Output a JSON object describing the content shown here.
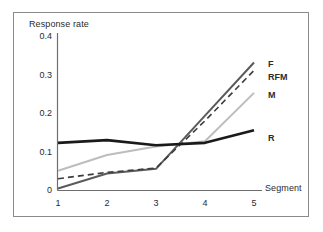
{
  "chart_data": {
    "type": "line",
    "title": "",
    "xlabel": "Segment",
    "ylabel": "Response rate",
    "x": [
      1,
      2,
      3,
      4,
      5
    ],
    "categories": [
      "1",
      "2",
      "3",
      "4",
      "5"
    ],
    "xtick_labels": [
      "1",
      "2",
      "3",
      "4",
      "5"
    ],
    "ytick_labels": [
      "0.4",
      "0.3",
      "0.2",
      "0.1",
      "0"
    ],
    "ytick_values": [
      0.4,
      0.3,
      0.2,
      0.1,
      0
    ],
    "xlim": [
      1,
      5
    ],
    "ylim": [
      0,
      0.4
    ],
    "grid": false,
    "legend_position": "right-inline",
    "series": [
      {
        "name": "F",
        "label": "F",
        "values": [
          0.005,
          0.043,
          0.055,
          0.19,
          0.325
        ],
        "color": "#5a5a5a",
        "style": "solid",
        "width": 2.0
      },
      {
        "name": "RFM",
        "label": "RFM",
        "values": [
          0.03,
          0.046,
          0.057,
          0.177,
          0.305
        ],
        "color": "#3d3d3d",
        "style": "dashed",
        "width": 1.6
      },
      {
        "name": "M",
        "label": "M",
        "values": [
          0.05,
          0.09,
          0.112,
          0.125,
          0.248
        ],
        "color": "#bdbdbd",
        "style": "solid",
        "width": 2.0
      },
      {
        "name": "R",
        "label": "R",
        "values": [
          0.121,
          0.128,
          0.115,
          0.121,
          0.153
        ],
        "color": "#1a1a1a",
        "style": "solid",
        "width": 2.6
      }
    ]
  },
  "axis": {
    "y_title": "Response rate",
    "x_title": "Segment",
    "y_ticks": [
      "0.4",
      "0.3",
      "0.2",
      "0.1",
      "0"
    ],
    "x_ticks": [
      "1",
      "2",
      "3",
      "4",
      "5"
    ]
  },
  "legend": {
    "items": [
      {
        "label": "F"
      },
      {
        "label": "RFM"
      },
      {
        "label": "M"
      },
      {
        "label": "R"
      }
    ]
  },
  "colors": {
    "frame_border": "#8a8a8a",
    "axis_line": "#6e6e6e",
    "text": "#2b2b2b",
    "background": "#ffffff",
    "series_f": "#5a5a5a",
    "series_rfm": "#3d3d3d",
    "series_m": "#bdbdbd",
    "series_r": "#1a1a1a"
  }
}
